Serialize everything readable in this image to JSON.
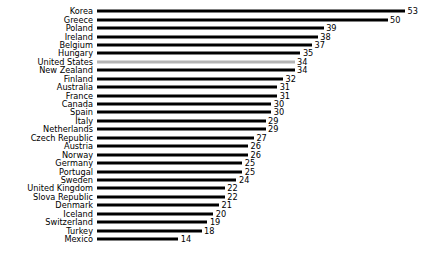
{
  "chart_data": {
    "type": "bar",
    "orientation": "horizontal",
    "title": "",
    "xlabel": "",
    "ylabel": "",
    "xlim": [
      0,
      53
    ],
    "grid": false,
    "legend": false,
    "highlight_category": "United States",
    "colors": {
      "bar": "#000000",
      "highlight_bar": "#b4b4b4",
      "text": "#000000",
      "background": "#ffffff"
    },
    "categories": [
      "Korea",
      "Greece",
      "Poland",
      "Ireland",
      "Belgium",
      "Hungary",
      "United States",
      "New Zealand",
      "Finland",
      "Australia",
      "France",
      "Canada",
      "Spain",
      "Italy",
      "Netherlands",
      "Czech Republic",
      "Austria",
      "Norway",
      "Germany",
      "Portugal",
      "Sweden",
      "United Kingdom",
      "Slova Republic",
      "Denmark",
      "Iceland",
      "Switzerland",
      "Turkey",
      "Mexico"
    ],
    "values": [
      53,
      50,
      39,
      38,
      37,
      35,
      34,
      34,
      32,
      31,
      31,
      30,
      30,
      29,
      29,
      27,
      26,
      26,
      25,
      25,
      24,
      22,
      22,
      21,
      20,
      19,
      18,
      14
    ]
  }
}
